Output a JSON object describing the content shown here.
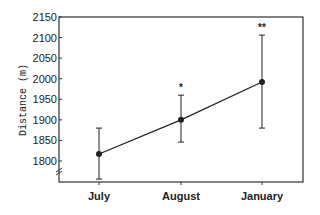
{
  "chart_data": {
    "type": "line",
    "title": "",
    "xlabel": "",
    "ylabel": "Distance (m)",
    "categories": [
      "July",
      "August",
      "January"
    ],
    "series": [
      {
        "name": "Distance",
        "values": [
          1817,
          1900,
          1992
        ],
        "error_upper": [
          1880,
          1960,
          2106
        ],
        "error_lower": [
          1756,
          1846,
          1880
        ]
      }
    ],
    "annotations": [
      "",
      "*",
      "**"
    ],
    "yticks": [
      1800,
      1850,
      1900,
      1950,
      2000,
      2050,
      2100,
      2150
    ],
    "ylim": [
      1750,
      2150
    ],
    "axis_break": true,
    "grid": false,
    "legend": "none",
    "colors": {
      "line": "#222222",
      "axis": "#333333"
    }
  }
}
